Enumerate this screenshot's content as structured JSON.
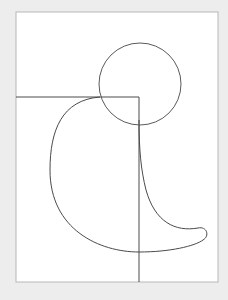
{
  "canvas": {
    "width": 228,
    "height": 300,
    "background": "#ededed"
  },
  "frame": {
    "x": 16,
    "y": 12,
    "width": 202,
    "height": 270,
    "fill": "#ffffff",
    "stroke": "#b8b8b8"
  },
  "colors": {
    "line": "#4a4a4a",
    "circle": "#5a5a5a"
  },
  "shapes": {
    "circle": {
      "cx": 140,
      "cy": 84,
      "r": 41
    },
    "horizontal_line": {
      "x1": 16,
      "y1": 97,
      "x2": 139,
      "y2": 97
    },
    "vertical_line": {
      "x1": 139,
      "y1": 97,
      "x2": 139,
      "y2": 282
    },
    "blob_path": "M 100 97 C 62 100, 50 130, 50 170 C 50 230, 100 252, 139 252 C 170 252, 195 246, 203 240 C 210 236, 207 226, 198 228 C 175 232, 155 222, 146 190 C 141 170, 139 150, 139 120"
  }
}
